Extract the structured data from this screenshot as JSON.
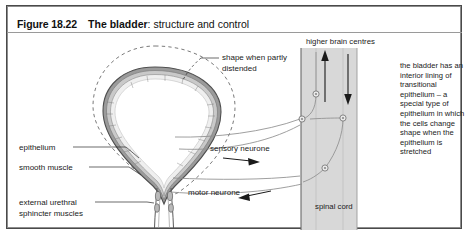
{
  "figure": {
    "number_label": "Figure 18.22",
    "title_bold": "The bladder",
    "title_rest": ": structure and control"
  },
  "labels": {
    "epithelium": "epithelium",
    "smooth_muscle": "smooth muscle",
    "external_sphincter": "external urethral sphincter muscles",
    "shape_distended": "shape when partly distended",
    "sensory_neurone": "sensory neurone",
    "motor_neurone": "motor neurone",
    "higher_brain_centres": "higher brain centres",
    "spinal_cord": "spinal cord"
  },
  "annotation": {
    "paragraph": "the bladder has an interior lining of transitional epithelium – a special type of epithelium in which the cells change shape when the epithelium is stretched"
  },
  "icons": {
    "sensory_arrow": "arrow-right-icon",
    "motor_arrow": "arrow-left-icon",
    "ascending_arrow": "arrow-up-icon",
    "descending_arrow": "arrow-down-icon"
  },
  "colors": {
    "frame_border": "#4a4a4a",
    "spinal_cord_fill": "#d8d8d8",
    "bladder_wall": "#6e6e6e",
    "dashed_outline": "#777777",
    "text": "#1a1a1a"
  }
}
